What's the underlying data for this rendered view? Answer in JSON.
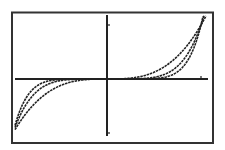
{
  "chart_data": {
    "type": "line",
    "title": "",
    "xlabel": "",
    "ylabel": "",
    "xlim": [
      -1.02,
      1.13
    ],
    "ylim": [
      -1.05,
      1.2
    ],
    "xticks": [
      1
    ],
    "yticks": [
      1,
      -1
    ],
    "grid": false,
    "legend": null,
    "series": [
      {
        "name": "y = x^3",
        "exponent": 3
      },
      {
        "name": "y = x^5",
        "exponent": 5
      },
      {
        "name": "y = x^7",
        "exponent": 7
      }
    ],
    "colors": {
      "background": "#ffffff",
      "line": "#222222",
      "frame": "#333333"
    }
  }
}
